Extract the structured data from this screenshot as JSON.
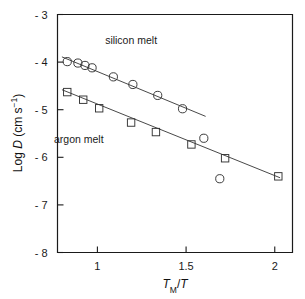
{
  "chart_data": {
    "type": "scatter",
    "title": "",
    "xlabel": "T_M/T",
    "xlabel_parts": {
      "main": "T",
      "sub": "M",
      "divider": "/",
      "second": "T"
    },
    "ylabel": "Log D (cm s-1)",
    "ylabel_parts": {
      "prefix": "Log ",
      "italic": "D",
      "unit": " (cm s",
      "exp": "−1",
      "close": ")"
    },
    "xlim": [
      0.775,
      2.1
    ],
    "ylim": [
      -8,
      -3
    ],
    "grid": false,
    "legend": "inline-annotations",
    "xticks": [
      1,
      1.5,
      2
    ],
    "xtick_labels": [
      "1",
      "1.5",
      "2"
    ],
    "yticks": [
      -3,
      -4,
      -5,
      -6,
      -7,
      -8
    ],
    "ytick_labels": [
      "- 3",
      "- 4",
      "- 5",
      "- 6",
      "- 7",
      "- 8"
    ],
    "series": [
      {
        "name": "silicon melt",
        "marker": "circle",
        "label_x": 1.19,
        "label_y": -3.63,
        "x": [
          0.83,
          0.89,
          0.93,
          0.97,
          1.09,
          1.2,
          1.34,
          1.48,
          1.6,
          1.69
        ],
        "y": [
          -3.99,
          -4.02,
          -4.07,
          -4.12,
          -4.31,
          -4.47,
          -4.7,
          -4.98,
          -5.6,
          -6.45
        ],
        "fit_x": [
          0.8,
          1.61
        ],
        "fit_y": [
          -3.89,
          -5.14
        ]
      },
      {
        "name": "argon melt",
        "marker": "square",
        "label_x": 0.895,
        "label_y": -5.7,
        "x": [
          0.83,
          0.92,
          1.01,
          1.19,
          1.33,
          1.53,
          1.72,
          2.02
        ],
        "y": [
          -4.63,
          -4.79,
          -4.97,
          -5.27,
          -5.47,
          -5.73,
          -6.02,
          -6.4
        ],
        "fit_x": [
          0.8,
          2.03
        ],
        "fit_y": [
          -4.58,
          -6.43
        ]
      }
    ]
  }
}
